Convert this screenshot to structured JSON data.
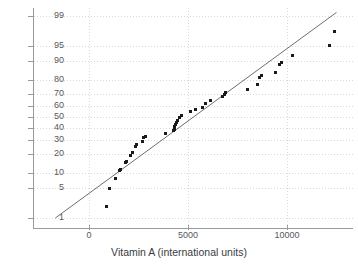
{
  "chart_data": {
    "type": "scatter",
    "title": "",
    "subtitle": "",
    "xlabel": "Vitamin A (international units)",
    "ylabel": "",
    "xlim": [
      -2200,
      13100
    ],
    "ylim_percent": [
      0.6,
      99.5
    ],
    "y_scale": "normal probability",
    "grid": true,
    "legend": null,
    "x_ticks": [
      {
        "value": 0,
        "label": "0"
      },
      {
        "value": 5000,
        "label": "5000"
      },
      {
        "value": 10000,
        "label": "10000"
      }
    ],
    "y_ticks": [
      {
        "value": 1,
        "label": "1"
      },
      {
        "value": 5,
        "label": "5"
      },
      {
        "value": 10,
        "label": "10"
      },
      {
        "value": 20,
        "label": "20"
      },
      {
        "value": 30,
        "label": "30"
      },
      {
        "value": 40,
        "label": "40"
      },
      {
        "value": 50,
        "label": "50"
      },
      {
        "value": 60,
        "label": "60"
      },
      {
        "value": 70,
        "label": "70"
      },
      {
        "value": 80,
        "label": "80"
      },
      {
        "value": 90,
        "label": "90"
      },
      {
        "value": 95,
        "label": "95"
      },
      {
        "value": 99,
        "label": "99"
      }
    ],
    "series": [
      {
        "name": "Vitamin A sample",
        "marker": "square",
        "color": "#1a1a1a",
        "points": [
          {
            "x": 880,
            "y": 2.0
          },
          {
            "x": 1030,
            "y": 5.0
          },
          {
            "x": 1350,
            "y": 8.0
          },
          {
            "x": 1520,
            "y": 11.0
          },
          {
            "x": 1600,
            "y": 11.5
          },
          {
            "x": 1820,
            "y": 14.5
          },
          {
            "x": 1900,
            "y": 15.5
          },
          {
            "x": 2100,
            "y": 19.0
          },
          {
            "x": 2180,
            "y": 21.0
          },
          {
            "x": 2350,
            "y": 25.0
          },
          {
            "x": 2420,
            "y": 26.0
          },
          {
            "x": 2700,
            "y": 29.0
          },
          {
            "x": 2770,
            "y": 32.0
          },
          {
            "x": 2830,
            "y": 32.5
          },
          {
            "x": 3880,
            "y": 35.0
          },
          {
            "x": 4280,
            "y": 37.5
          },
          {
            "x": 4320,
            "y": 39.0
          },
          {
            "x": 4340,
            "y": 41.0
          },
          {
            "x": 4360,
            "y": 43.0
          },
          {
            "x": 4400,
            "y": 45.0
          },
          {
            "x": 4480,
            "y": 47.0
          },
          {
            "x": 4560,
            "y": 50.0
          },
          {
            "x": 4680,
            "y": 51.0
          },
          {
            "x": 5150,
            "y": 55.0
          },
          {
            "x": 5400,
            "y": 57.0
          },
          {
            "x": 5750,
            "y": 59.0
          },
          {
            "x": 5900,
            "y": 62.0
          },
          {
            "x": 6150,
            "y": 65.0
          },
          {
            "x": 6750,
            "y": 68.0
          },
          {
            "x": 6850,
            "y": 70.0
          },
          {
            "x": 6900,
            "y": 71.0
          },
          {
            "x": 8000,
            "y": 74.0
          },
          {
            "x": 8500,
            "y": 77.0
          },
          {
            "x": 8600,
            "y": 82.0
          },
          {
            "x": 8700,
            "y": 83.0
          },
          {
            "x": 9400,
            "y": 85.0
          },
          {
            "x": 9600,
            "y": 88.5
          },
          {
            "x": 9700,
            "y": 89.5
          },
          {
            "x": 10300,
            "y": 92.0
          },
          {
            "x": 12150,
            "y": 95.0
          },
          {
            "x": 12400,
            "y": 97.5
          }
        ]
      }
    ],
    "reference_line": {
      "name": "normal fit line",
      "color": "#6e6e72",
      "start": {
        "x": -1700,
        "y": 1.0
      },
      "end": {
        "x": 12500,
        "y": 99.2
      }
    }
  }
}
